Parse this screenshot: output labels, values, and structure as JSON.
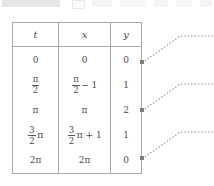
{
  "chrome": {
    "description": "partially cropped application chrome strip",
    "chips": [
      "toolbar-pill",
      "page-box",
      "tool-1",
      "tool-2",
      "tool-3",
      "tool-4",
      "tool-5"
    ]
  },
  "table": {
    "name": "parametric-values-table",
    "headers": {
      "t": "t",
      "x": "x",
      "y": "y"
    },
    "rows": [
      {
        "t": {
          "type": "plain",
          "text": "0"
        },
        "x": {
          "type": "plain",
          "text": "0"
        },
        "y": "0"
      },
      {
        "t": {
          "type": "fraction",
          "num": "π",
          "den": "2",
          "tail": ""
        },
        "x": {
          "type": "fraction",
          "num": "π",
          "den": "2",
          "tail": "− 1"
        },
        "y": "1"
      },
      {
        "t": {
          "type": "plain",
          "text": "π"
        },
        "x": {
          "type": "plain",
          "text": "π"
        },
        "y": "2"
      },
      {
        "t": {
          "type": "fraction",
          "num": "3",
          "den": "2",
          "tail": "π"
        },
        "x": {
          "type": "fraction",
          "num": "3",
          "den": "2",
          "tail": "π + 1"
        },
        "y": "1"
      },
      {
        "t": {
          "type": "plain",
          "text": "2π"
        },
        "x": {
          "type": "plain",
          "text": "2π"
        },
        "y": "0"
      }
    ]
  },
  "connectors": {
    "marker_color": "#7d7d7d",
    "line_color": "#9a9a9a",
    "style": "dotted",
    "items": [
      {
        "name": "connector-row-0",
        "from_row": "0",
        "marker_x": 142,
        "marker_y": 62
      },
      {
        "name": "connector-row-2",
        "from_row": "2",
        "marker_x": 142,
        "marker_y": 110
      },
      {
        "name": "connector-row-4",
        "from_row": "4",
        "marker_x": 142,
        "marker_y": 158
      }
    ]
  },
  "colors": {
    "border": "#a9a9a9",
    "text": "#4c4c4c",
    "background": "#ffffff"
  }
}
